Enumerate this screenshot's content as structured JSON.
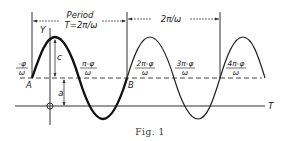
{
  "figure": {
    "caption": "Fig. 1",
    "period_label": "Period",
    "period_formula": "T=2π/ω",
    "second_period_label": "2π/ω",
    "axis_y_label": "Y",
    "axis_t_label": "T",
    "amplitude_label": "c",
    "offset_label": "a",
    "point_a_label": "A",
    "point_b_label": "B",
    "ticks": [
      {
        "num": "-φ",
        "den": "ω"
      },
      {
        "num": "π-φ",
        "den": "ω"
      },
      {
        "num": "2π-φ",
        "den": "ω"
      },
      {
        "num": "3π-φ",
        "den": "ω"
      },
      {
        "num": "4π-φ",
        "den": "ω"
      }
    ]
  },
  "colors": {
    "ink": "#222222",
    "background": "#ffffff"
  }
}
